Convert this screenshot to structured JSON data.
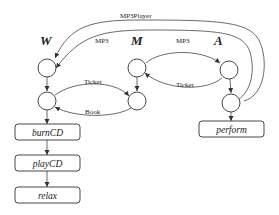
{
  "diagram": {
    "roles": [
      {
        "id": "W",
        "label": "W"
      },
      {
        "id": "M",
        "label": "M"
      },
      {
        "id": "A",
        "label": "A"
      }
    ],
    "messages": [
      {
        "label": "MP3Player",
        "from": "A",
        "to": "W"
      },
      {
        "label": "MP3",
        "from": "A",
        "to": "W"
      },
      {
        "label": "MP3",
        "from": "M",
        "to": "A"
      },
      {
        "label": "Ticket",
        "from": "A",
        "to": "M"
      },
      {
        "label": "Ticket",
        "from": "W",
        "to": "M"
      },
      {
        "label": "Book",
        "from": "M",
        "to": "W"
      }
    ],
    "actions": [
      {
        "label": "burnCD",
        "role": "W"
      },
      {
        "label": "playCD",
        "role": "W"
      },
      {
        "label": "relax",
        "role": "W"
      },
      {
        "label": "perform",
        "role": "A"
      }
    ]
  }
}
